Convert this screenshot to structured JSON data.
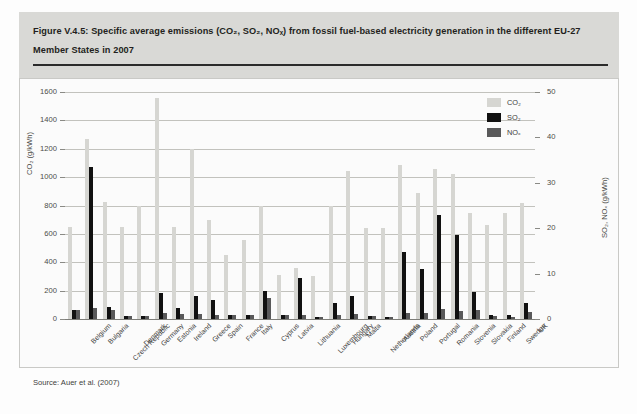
{
  "figure": {
    "caption_line1": "Figure V.4.5: Specific average emissions (CO₂, SO₂, NOₓ) from fossil fuel-based electricity generation in the different EU-27",
    "caption_line2": "Member States in 2007",
    "source": "Source: Auer et al. (2007)"
  },
  "legend": {
    "position": "top-right",
    "entries": [
      {
        "label": "CO₂",
        "color": "#d6d6d2"
      },
      {
        "label": "SO₂",
        "color": "#111111"
      },
      {
        "label": "NOₓ",
        "color": "#59595a"
      }
    ]
  },
  "colors": {
    "co2": "#d6d6d2",
    "so2": "#111111",
    "nox": "#59595a",
    "header_band": "#d9d9d6",
    "grid": "#c2c2bd",
    "text": "#231f20"
  },
  "axes": {
    "left": {
      "title": "CO₂ (g/kWh)",
      "ticks": [
        0,
        200,
        400,
        600,
        800,
        1000,
        1200,
        1400,
        1600
      ],
      "min": 0,
      "max": 1600
    },
    "right": {
      "title": "SO₂, NOₓ (g/kWh)",
      "ticks": [
        0,
        10,
        20,
        30,
        40,
        50
      ],
      "min": 0,
      "max": 50
    }
  },
  "chart_data": {
    "type": "bar",
    "title": "Specific average emissions (CO₂, SO₂, NOₓ) from fossil fuel-based electricity generation in the different EU-27 Member States in 2007",
    "xlabel": "",
    "ylabel": "CO₂ (g/kWh)",
    "ylabel_secondary": "SO₂, NOₓ (g/kWh)",
    "ylim": [
      0,
      1600
    ],
    "ylim_secondary": [
      0,
      50
    ],
    "grid": true,
    "legend_position": "top-right",
    "categories": [
      "Belgium",
      "Bulgaria",
      "Czech Republic",
      "Denmark",
      "Germany",
      "Estonia",
      "Ireland",
      "Greece",
      "Spain",
      "France",
      "Italy",
      "Cyprus",
      "Latvia",
      "Lithuania",
      "Luxembourg",
      "Hungary",
      "Malta",
      "Netherlands",
      "Austria",
      "Poland",
      "Portugal",
      "Romania",
      "Slovenia",
      "Slovakia",
      "Finland",
      "Sweden",
      "UK"
    ],
    "series": [
      {
        "name": "CO₂",
        "axis": "left",
        "unit": "g/kWh",
        "color": "#d6d6d2",
        "values": [
          650,
          1270,
          825,
          650,
          800,
          1560,
          650,
          1200,
          700,
          450,
          555,
          800,
          310,
          360,
          305,
          800,
          1040,
          645,
          645,
          1085,
          890,
          1055,
          1020,
          745,
          660,
          745,
          820
        ]
      },
      {
        "name": "SO₂",
        "axis": "right",
        "unit": "g/kWh",
        "color": "#111111",
        "values": [
          2.0,
          33.5,
          2.7,
          0.7,
          0.6,
          5.8,
          2.5,
          5.0,
          4.2,
          1.0,
          0.9,
          6.2,
          1.0,
          9.0,
          0.4,
          3.5,
          5.0,
          0.6,
          0.5,
          14.7,
          11.1,
          23.0,
          18.5,
          6.0,
          1.0,
          0.8,
          3.6
        ]
      },
      {
        "name": "NOₓ",
        "axis": "right",
        "unit": "g/kWh",
        "color": "#59595a",
        "values": [
          1.9,
          2.5,
          1.9,
          0.7,
          0.6,
          1.3,
          1.1,
          1.2,
          1.0,
          1.0,
          0.9,
          4.6,
          1.0,
          1.0,
          0.4,
          1.0,
          1.1,
          0.6,
          0.5,
          1.4,
          1.4,
          2.2,
          1.7,
          2.0,
          0.6,
          0.5,
          1.6
        ]
      }
    ]
  }
}
